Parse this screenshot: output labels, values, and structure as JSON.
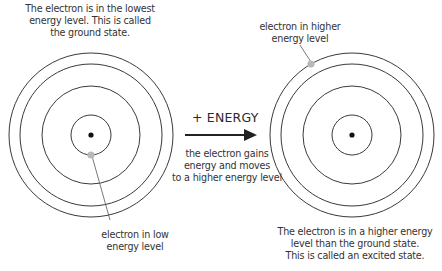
{
  "left_atom": {
    "caption": [
      "The electron is in the lowest",
      "energy level. This is called",
      "the ground state."
    ],
    "electron_label": [
      "electron in low",
      "energy level"
    ]
  },
  "transition": {
    "label": "+ ENERGY",
    "caption": [
      "the electron gains",
      "energy and moves",
      "to a higher energy level"
    ]
  },
  "right_atom": {
    "electron_label": [
      "electron in higher",
      "energy level"
    ],
    "caption": [
      "The electron is in a higher energy",
      "level than the ground state.",
      "This is called an excited state."
    ]
  },
  "colors": {
    "orbit": "#3a3a3a",
    "nucleus": "#111111",
    "electron": "#b8b8b8",
    "arrow": "#222222"
  }
}
